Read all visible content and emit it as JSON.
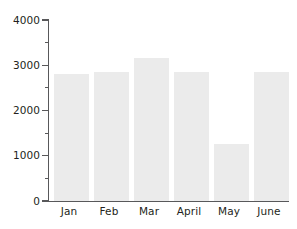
{
  "chart_data": {
    "type": "bar",
    "title": "",
    "subtitle": "",
    "xlabel": "",
    "ylabel": "",
    "categories": [
      "Jan",
      "Feb",
      "Mar",
      "April",
      "May",
      "June"
    ],
    "values": [
      2800,
      2850,
      3150,
      2850,
      1250,
      2850
    ],
    "series": [
      {
        "name": "",
        "values": [
          2800,
          2850,
          3150,
          2850,
          1250,
          2850
        ]
      }
    ],
    "ylim": [
      0,
      4000
    ],
    "y_major_ticks": [
      0,
      1000,
      2000,
      3000,
      4000
    ],
    "y_major_tick_labels": [
      "0",
      "1000",
      "2000",
      "3000",
      "4000"
    ],
    "y_minor_ticks": [
      500,
      1500,
      2500,
      3500
    ],
    "grid": false,
    "legend": null,
    "legend_position": "none",
    "annotations": [],
    "colors": {
      "bar_fill": "#ebebeb",
      "axis": "#58585a",
      "text": "#231f20",
      "background": "#ffffff"
    }
  }
}
